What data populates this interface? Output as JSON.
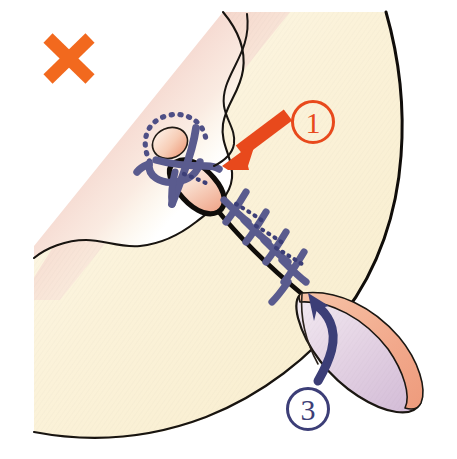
{
  "figure": {
    "kind": "medical-line-drawing",
    "width": 457,
    "height": 459,
    "background": "#ffffff"
  },
  "annotations": {
    "incorrect_mark": {
      "name": "x-mark",
      "glyph": "✕",
      "meaning": "incorrect",
      "color": "#F2691E",
      "x": 68,
      "y": 58
    },
    "callouts": [
      {
        "id": "callout-1",
        "label": "①",
        "number": "1",
        "color": "#E8491C",
        "circle_x": 313,
        "circle_y": 122,
        "circle_r": 20
      },
      {
        "id": "callout-3",
        "label": "③",
        "number": "3",
        "color": "#3C3E77",
        "circle_x": 308,
        "circle_y": 409,
        "circle_r": 20
      }
    ],
    "arrows": [
      {
        "id": "arrow-1",
        "points_to": "suture-opening",
        "color": "#E8491C",
        "direction": "down-left",
        "style": "straight"
      },
      {
        "id": "arrow-3",
        "points_to": "flap-base",
        "color": "#3C3E77",
        "direction": "up-left",
        "style": "curved"
      }
    ]
  },
  "colors": {
    "skin_cream": "#FAF1D8",
    "skin_cream_light": "#FDF8E9",
    "skin_pink": "#F3CEC6",
    "skin_pink_deep": "#EFC3BC",
    "wound_pink": "#F4B9A2",
    "wound_pink_light": "#FBE2D6",
    "flap_lavender": "#E8D8E8",
    "flap_lavender_deep": "#D9C3DC",
    "flap_rim_salmon": "#F2A98C",
    "suture_blue": "#5A5B8E",
    "suture_blue_dark": "#3C3E77",
    "outline_black": "#141414",
    "accent_orange": "#F2691E",
    "accent_red_orange": "#E8491C"
  },
  "parts": [
    {
      "name": "body-tissue",
      "description": "large cream coloured tissue mass filling most of the frame"
    },
    {
      "name": "pink-shaded-region",
      "description": "pink gradient shading along upper-left diagonal border"
    },
    {
      "name": "incision-line",
      "description": "black diagonal incision running from upper-left knot down to flap base"
    },
    {
      "name": "wavy-contour-line",
      "description": "thin wavy black contour line at upper centre"
    },
    {
      "name": "suture-knot-loop",
      "description": "blue thread loop with dotted hidden segments, knotted at wound top"
    },
    {
      "name": "wound-opening",
      "description": "lens shaped gaping opening with pink gradient fill"
    },
    {
      "name": "stitch-series",
      "description": "five cross stitches along the incision line"
    },
    {
      "name": "tissue-flap",
      "description": "leaf shaped lavender flap with salmon rim at lower right"
    }
  ],
  "stitch_count": 5,
  "loop_dot_count": 14
}
